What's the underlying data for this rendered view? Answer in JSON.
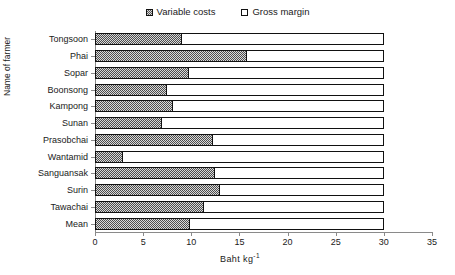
{
  "chart_data": {
    "type": "bar",
    "orientation": "horizontal",
    "stacked": true,
    "title": "",
    "xlabel": "Baht kg",
    "xlabel_sup": "-1",
    "ylabel": "Name of farmer",
    "xlim": [
      0,
      35
    ],
    "xticks": [
      0,
      5,
      10,
      15,
      20,
      25,
      30,
      35
    ],
    "grid": false,
    "legend_position": "top-center",
    "categories": [
      "Tongsoon",
      "Phai",
      "Sopar",
      "Boonsong",
      "Kampong",
      "Sunan",
      "Prasobchai",
      "Wantamid",
      "Sanguansak",
      "Surin",
      "Tawachai",
      "Mean"
    ],
    "series": [
      {
        "name": "Variable costs",
        "color": "#d9d9d9",
        "pattern": "checker",
        "values": [
          9.0,
          15.8,
          9.8,
          7.5,
          8.1,
          7.0,
          12.3,
          2.9,
          12.5,
          13.0,
          11.3,
          9.9
        ]
      },
      {
        "name": "Gross margin",
        "color": "#ffffff",
        "pattern": "solid",
        "values": [
          21.0,
          14.2,
          20.2,
          22.5,
          21.9,
          23.0,
          17.7,
          27.1,
          17.5,
          17.0,
          18.7,
          20.1
        ]
      }
    ],
    "totals": [
      30,
      30,
      30,
      30,
      30,
      30,
      30,
      30,
      30,
      30,
      30,
      30
    ]
  },
  "legend": {
    "entries": [
      {
        "label": "Variable costs",
        "swatch": "variable-costs-swatch"
      },
      {
        "label": "Gross margin",
        "swatch": "gross-margin-swatch"
      }
    ]
  }
}
